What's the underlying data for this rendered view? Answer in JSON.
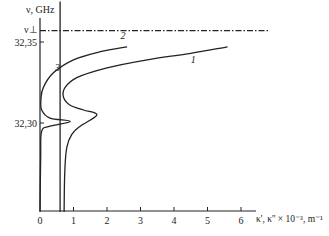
{
  "chart_data": {
    "type": "line",
    "title": "",
    "xlabel": "κ', κ'' × 10⁻³, m⁻¹",
    "ylabel": "ν, GHz",
    "xlim": [
      0,
      6.5
    ],
    "ylim": [
      32.245,
      32.375
    ],
    "x_ticks": [
      "0",
      "1",
      "2",
      "3",
      "4",
      "5",
      "6"
    ],
    "y_ticks": [
      "32,30",
      "32,35"
    ],
    "y_tick_values": [
      32.3,
      32.35
    ],
    "reference_line": {
      "label": "ν⊥",
      "value": 32.357,
      "style": "dash-dot"
    },
    "series": [
      {
        "name": "1",
        "points": [
          [
            0.72,
            32.245
          ],
          [
            0.74,
            32.27
          ],
          [
            0.8,
            32.285
          ],
          [
            0.95,
            32.293
          ],
          [
            1.2,
            32.298
          ],
          [
            1.7,
            32.305
          ],
          [
            1.3,
            32.308
          ],
          [
            0.9,
            32.311
          ],
          [
            0.7,
            32.316
          ],
          [
            0.75,
            32.322
          ],
          [
            1.1,
            32.328
          ],
          [
            2.0,
            32.334
          ],
          [
            3.2,
            32.339
          ],
          [
            4.5,
            32.343
          ],
          [
            5.6,
            32.347
          ]
        ]
      },
      {
        "name": "2",
        "points": [
          [
            0.0,
            32.245
          ],
          [
            0.02,
            32.28
          ],
          [
            0.05,
            32.295
          ],
          [
            0.3,
            32.298
          ],
          [
            0.9,
            32.301
          ],
          [
            0.3,
            32.303
          ],
          [
            0.05,
            32.308
          ],
          [
            0.03,
            32.315
          ],
          [
            0.1,
            32.322
          ],
          [
            0.4,
            32.331
          ],
          [
            1.0,
            32.339
          ],
          [
            1.8,
            32.344
          ],
          [
            2.6,
            32.347
          ]
        ]
      },
      {
        "name": "3",
        "points": [
          [
            0.6,
            32.245
          ],
          [
            0.6,
            32.375
          ]
        ]
      }
    ],
    "curve_labels": [
      "1",
      "2",
      "3"
    ],
    "grid": false,
    "legend": "none"
  }
}
